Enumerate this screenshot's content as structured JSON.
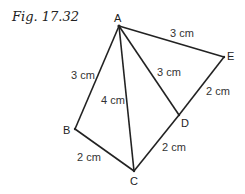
{
  "figure": {
    "title": "Fig. 17.32",
    "points": {
      "A": {
        "label": "A"
      },
      "B": {
        "label": "B"
      },
      "C": {
        "label": "C"
      },
      "D": {
        "label": "D"
      },
      "E": {
        "label": "E"
      }
    },
    "edges": [
      {
        "from": "A",
        "to": "B",
        "length": "3 cm"
      },
      {
        "from": "A",
        "to": "C",
        "length": "4 cm"
      },
      {
        "from": "A",
        "to": "D",
        "length": "3 cm"
      },
      {
        "from": "A",
        "to": "E",
        "length": "3 cm"
      },
      {
        "from": "B",
        "to": "C",
        "length": "2 cm"
      },
      {
        "from": "C",
        "to": "D",
        "length": "2 cm"
      },
      {
        "from": "D",
        "to": "E",
        "length": "2 cm"
      }
    ]
  }
}
